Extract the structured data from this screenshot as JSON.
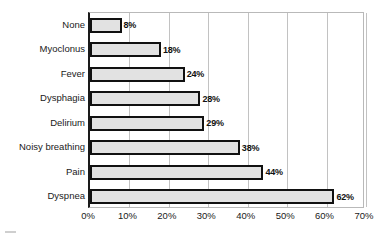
{
  "chart_data": {
    "type": "bar",
    "orientation": "horizontal",
    "title": "",
    "subtitle": "",
    "xlabel": "",
    "ylabel": "",
    "categories": [
      "None",
      "Myoclonus",
      "Fever",
      "Dysphagia",
      "Delirium",
      "Noisy breathing",
      "Pain",
      "Dyspnea"
    ],
    "values": [
      8,
      18,
      24,
      28,
      29,
      38,
      44,
      62
    ],
    "value_labels": [
      "8%",
      "18%",
      "24%",
      "28%",
      "29%",
      "38%",
      "44%",
      "62%"
    ],
    "xlim": [
      0,
      70
    ],
    "xticks": [
      0,
      10,
      20,
      30,
      40,
      50,
      60,
      70
    ],
    "xtick_labels": [
      "0%",
      "10%",
      "20%",
      "30%",
      "40%",
      "50%",
      "60%",
      "70%"
    ],
    "grid": true,
    "grid_axis": "x",
    "legend": null,
    "series": [
      {
        "name": "Prevalence",
        "values": [
          8,
          18,
          24,
          28,
          29,
          38,
          44,
          62
        ]
      }
    ],
    "colors": {
      "bar_fill": "#e2e2e2",
      "bar_border": "#111111",
      "gridline": "#c2c2c2",
      "axis": "#1a1a1a",
      "text": "#1a1a1a",
      "background": "#ffffff"
    }
  }
}
